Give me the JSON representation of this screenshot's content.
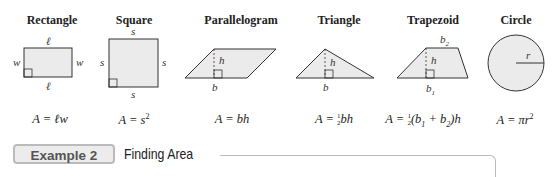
{
  "shapes": [
    {
      "name": "Rectangle",
      "formula": "A = ℓw",
      "labels": [
        "ℓ",
        "w",
        "w",
        "ℓ"
      ]
    },
    {
      "name": "Square",
      "formula": "A = s²",
      "labels": [
        "s",
        "s",
        "s",
        "s"
      ]
    },
    {
      "name": "Parallelogram",
      "formula": "A = bh",
      "labels": [
        "h",
        "b"
      ]
    },
    {
      "name": "Triangle",
      "formula": "A = ½bh",
      "labels": [
        "h",
        "b"
      ]
    },
    {
      "name": "Trapezoid",
      "formula": "A = ½(b₁ + b₂)h",
      "labels": [
        "b₂",
        "h",
        "b₁"
      ]
    },
    {
      "name": "Circle",
      "formula": "A = πr²",
      "labels": [
        "r"
      ]
    }
  ],
  "formulas": {
    "rect_lhs": "A = ℓw",
    "square_lhs": "A = s",
    "square_exp": "2",
    "para": "A = bh",
    "tri_lhs": "A = ",
    "tri_num": "1",
    "tri_den": "2",
    "tri_rhs": "bh",
    "trap_lhs": "A = ",
    "trap_num": "1",
    "trap_den": "2",
    "trap_rhs_a": "(b",
    "trap_sub1": "1",
    "trap_rhs_b": " + b",
    "trap_sub2": "2",
    "trap_rhs_c": ")h",
    "circle_lhs": "A = πr",
    "circle_exp": "2"
  },
  "example": {
    "badge": "Example 2",
    "title": "Finding Area"
  },
  "colors": {
    "shape_fill": "#ebebeb",
    "stroke": "#333333",
    "badge_border": "#bbbbbb"
  }
}
